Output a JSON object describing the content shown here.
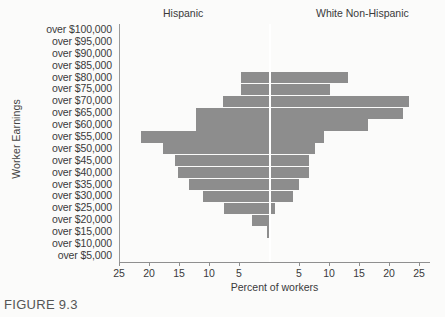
{
  "figure": {
    "caption": "FIGURE 9.3",
    "ylabel": "Worker Earnings",
    "xlabel": "Percent of workers",
    "group_left": "Hispanic",
    "group_right": "White Non-Hispanic"
  },
  "chart_data": {
    "type": "bar",
    "orientation": "horizontal-diverging",
    "title": "",
    "xlabel": "Percent of workers",
    "ylabel": "Worker Earnings",
    "xlim": [
      -25,
      25
    ],
    "xticks": [
      25,
      20,
      15,
      10,
      5,
      5,
      10,
      15,
      20,
      25
    ],
    "xtick_labels": [
      "25",
      "20",
      "15",
      "10",
      "5",
      "5",
      "10",
      "15",
      "20",
      "25"
    ],
    "grid": false,
    "legend": "none",
    "bar_color": "#8d8d8d",
    "categories": [
      "over $100,000",
      "over $95,000",
      "over $90,000",
      "over $85,000",
      "over $80,000",
      "over $75,000",
      "over $70,000",
      "over $65,000",
      "over $60,000",
      "over $55,000",
      "over $50,000",
      "over $45,000",
      "over $40,000",
      "over $35,000",
      "over $30,000",
      "over $25,000",
      "over $20,000",
      "over $15,000",
      "over $10,000",
      "over $5,000"
    ],
    "series": [
      {
        "name": "Hispanic",
        "side": "left",
        "values": [
          0,
          0,
          0,
          0,
          4.6,
          4.7,
          7.6,
          12.2,
          12.2,
          21.3,
          17.6,
          15.6,
          15.1,
          13.3,
          11.0,
          7.5,
          2.9,
          0.3,
          0,
          0
        ]
      },
      {
        "name": "White Non-Hispanic",
        "side": "right",
        "values": [
          0,
          0,
          0,
          0,
          13.2,
          10.2,
          23.3,
          22.3,
          16.5,
          9.2,
          7.7,
          6.6,
          6.6,
          5.0,
          4.0,
          1.0,
          0.3,
          0.3,
          0,
          0
        ]
      }
    ]
  }
}
